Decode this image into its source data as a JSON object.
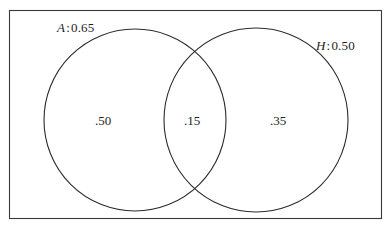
{
  "figure": {
    "type": "venn-diagram",
    "background_color": "#ffffff",
    "stroke_color": "#2b2b2b",
    "text_color": "#1d1d1d"
  },
  "sample_space": {
    "name": "sample-space-rectangle",
    "x": 9,
    "y": 10,
    "width": 373,
    "height": 209
  },
  "sets": [
    {
      "id": "A",
      "variable": "A",
      "colon": ":",
      "probability": "0.65",
      "label": "A : 0.65",
      "circle": {
        "cx": 135,
        "cy": 120,
        "r": 91
      }
    },
    {
      "id": "H",
      "variable": "H",
      "colon": ":",
      "probability": "0.50",
      "label": "H : 0.50",
      "circle": {
        "cx": 256,
        "cy": 120,
        "r": 92
      }
    }
  ],
  "regions": [
    {
      "id": "a-only",
      "label": ".50",
      "value": 0.5,
      "x": 103,
      "y": 121
    },
    {
      "id": "both",
      "label": ".15",
      "value": 0.15,
      "x": 192,
      "y": 121
    },
    {
      "id": "h-only",
      "label": ".35",
      "value": 0.35,
      "x": 278,
      "y": 121
    }
  ]
}
